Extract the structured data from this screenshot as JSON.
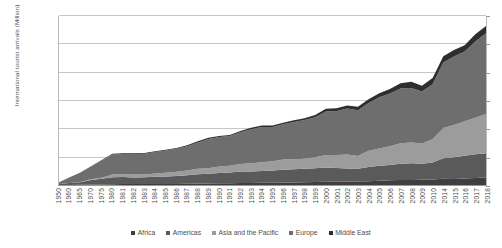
{
  "chart_data": {
    "type": "area",
    "stacked": true,
    "title": "",
    "xlabel": "",
    "ylabel": "International tourist arrivals (Million)",
    "ylim": [
      0,
      1500
    ],
    "yticks": [
      0,
      250,
      500,
      750,
      1000,
      1250,
      1500
    ],
    "ytick_labels": [
      "0",
      "250",
      "500",
      "750",
      "1,000",
      "1,250",
      "1,500"
    ],
    "grid": true,
    "legend_position": "bottom",
    "categories": [
      "1950",
      "1960",
      "1965",
      "1970",
      "1975",
      "1980",
      "1981",
      "1982",
      "1983",
      "1984",
      "1985",
      "1986",
      "1987",
      "1988",
      "1989",
      "1990",
      "1991",
      "1992",
      "1993",
      "1994",
      "1995",
      "1996",
      "1997",
      "1998",
      "1999",
      "2000",
      "2001",
      "2002",
      "2003",
      "2004",
      "2005",
      "2006",
      "2007",
      "2008",
      "2009",
      "2010",
      "2014",
      "2015",
      "2016",
      "2017",
      "2018"
    ],
    "series": [
      {
        "name": "Africa",
        "color": "#3f3f3f",
        "values": [
          0.5,
          0.8,
          1.4,
          2.4,
          4.7,
          7.2,
          8.1,
          7.8,
          8.2,
          8.8,
          9.7,
          9.4,
          10.2,
          12.4,
          13.8,
          14.8,
          16.2,
          17.9,
          18.6,
          18.9,
          18.9,
          21.5,
          23.0,
          25.4,
          26.5,
          27.9,
          29.1,
          30.0,
          31.0,
          34.1,
          37.3,
          41.4,
          45.0,
          44.4,
          45.9,
          49.9,
          55.3,
          53.5,
          57.8,
          63.0,
          67.1
        ]
      },
      {
        "name": "Americas",
        "color": "#5a5a5a",
        "values": [
          7.5,
          16.7,
          23.2,
          42.3,
          50.0,
          62.3,
          62.5,
          59.7,
          59.9,
          64.1,
          65.1,
          70.9,
          76.2,
          83.0,
          87.0,
          92.8,
          95.3,
          102.1,
          102.2,
          105.1,
          109.0,
          114.5,
          116.2,
          119.1,
          122.2,
          128.2,
          122.1,
          116.6,
          113.1,
          125.7,
          133.3,
          135.8,
          142.9,
          148.0,
          141.7,
          150.1,
          181.9,
          193.9,
          201.1,
          210.8,
          215.7
        ]
      },
      {
        "name": "Asia and the Pacific",
        "color": "#9c9c9c",
        "values": [
          0.2,
          0.9,
          2.1,
          6.2,
          10.2,
          23.0,
          24.9,
          25.3,
          26.2,
          29.2,
          32.9,
          36.4,
          41.6,
          47.9,
          48.7,
          56.2,
          58.3,
          66.6,
          72.0,
          78.1,
          82.1,
          89.5,
          89.1,
          89.0,
          98.3,
          110.4,
          115.7,
          124.9,
          113.3,
          144.2,
          154.0,
          166.0,
          182.0,
          184.1,
          181.1,
          205.4,
          269.0,
          284.1,
          306.1,
          323.1,
          347.7
        ]
      },
      {
        "name": "Europe",
        "color": "#6e6e6e",
        "values": [
          16.8,
          50.4,
          83.7,
          113.0,
          153.9,
          177.3,
          180.0,
          183.0,
          183.3,
          190.0,
          198.0,
          205.0,
          217.0,
          235.0,
          259.0,
          261.5,
          265.0,
          281.0,
          303.0,
          312.0,
          304.1,
          313.0,
          330.0,
          343.0,
          355.0,
          386.6,
          390.8,
          407.1,
          407.1,
          424.4,
          453.2,
          468.4,
          487.3,
          485.2,
          461.7,
          488.9,
          580.2,
          609.7,
          619.2,
          677.0,
          716.1
        ]
      },
      {
        "name": "Middle East",
        "color": "#2e2e2e",
        "values": [
          0.2,
          0.6,
          1.1,
          1.9,
          3.5,
          7.1,
          7.3,
          7.0,
          6.8,
          7.3,
          7.5,
          7.6,
          8.2,
          9.1,
          9.9,
          9.6,
          8.2,
          11.0,
          12.2,
          13.6,
          13.7,
          15.0,
          15.3,
          16.3,
          18.2,
          24.1,
          23.6,
          27.1,
          29.5,
          33.7,
          36.3,
          39.9,
          45.9,
          54.3,
          50.7,
          54.7,
          55.7,
          58.1,
          57.2,
          63.3,
          64.0
        ]
      }
    ]
  }
}
